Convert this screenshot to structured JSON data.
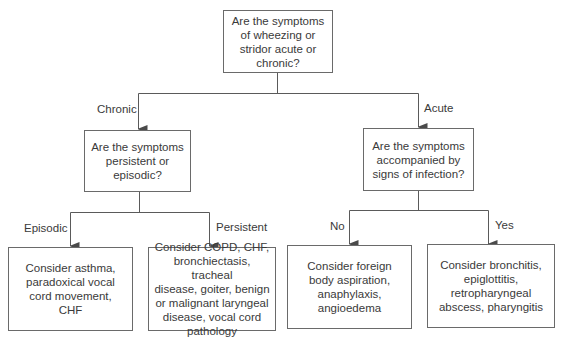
{
  "diagram": {
    "type": "decision-flowchart",
    "root": {
      "question": "Are the symptoms\nof wheezing or\nstridor acute or\nchronic?"
    },
    "branches": {
      "chronic": {
        "edge_label": "Chronic",
        "question": "Are the symptoms\npersistent or\nepisodic?",
        "outcomes": {
          "episodic": {
            "edge_label": "Episodic",
            "text": "Consider asthma,\nparadoxical vocal\ncord movement,\nCHF"
          },
          "persistent": {
            "edge_label": "Persistent",
            "text": "Consider COPD, CHF,\nbronchiectasis, tracheal\ndisease, goiter, benign\nor malignant laryngeal\ndisease, vocal cord\npathology"
          }
        }
      },
      "acute": {
        "edge_label": "Acute",
        "question": "Are the symptoms\naccompanied by\nsigns of infection?",
        "outcomes": {
          "no": {
            "edge_label": "No",
            "text": "Consider foreign\nbody aspiration,\nanaphylaxis,\nangioedema"
          },
          "yes": {
            "edge_label": "Yes",
            "text": "Consider bronchitis,\nepiglottitis,\nretropharyngeal\nabscess, pharyngitis"
          }
        }
      }
    },
    "colors": {
      "line": "#5a5a5a",
      "border": "#6a6a6a",
      "text": "#3a3a3a",
      "background": "#ffffff"
    }
  }
}
